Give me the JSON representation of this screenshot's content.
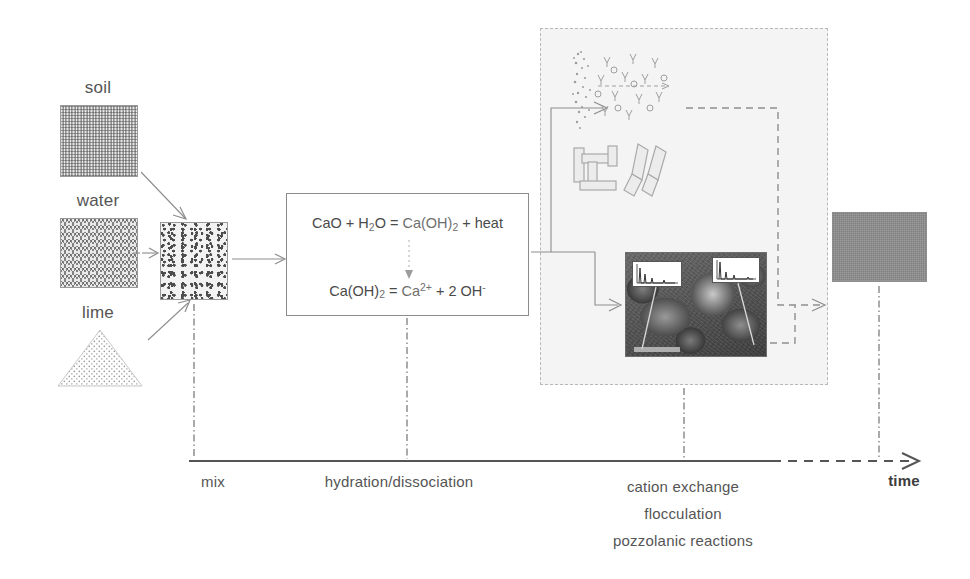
{
  "inputs": [
    {
      "key": "soil",
      "label": "soil",
      "icon": "soil-texture-swatch"
    },
    {
      "key": "water",
      "label": "water",
      "icon": "water-wave-swatch"
    },
    {
      "key": "lime",
      "label": "lime",
      "icon": "lime-powder-triangle"
    }
  ],
  "mix": {
    "label": "mix",
    "icon": "mixed-soil-swatch"
  },
  "reactions": {
    "equation_1": {
      "part_a": "CaO + H",
      "sub_a": "2",
      "part_b": "O = ",
      "part_c": "Ca(OH)",
      "sub_c": "2",
      "part_d": " + heat",
      "plain": "CaO + H2O = Ca(OH)2 + heat"
    },
    "equation_2": {
      "part_a": "Ca(OH)",
      "sub_a": "2",
      "part_b": " = ",
      "part_c": "Ca",
      "sup_c": "2+",
      "part_d": " + 2 OH",
      "sup_d": "-",
      "plain": "Ca(OH)2 = Ca2+ + 2 OH-"
    },
    "stage_label": "hydration/dissociation"
  },
  "micro_panel": {
    "diffuse_layer_caption": "clay-particle-diffuse-double-layer",
    "fabric_caption": "dispersed-and-flocculated-clay-fabric",
    "micrograph_caption": "sem-micrograph-with-eds-spectra-insets",
    "stage_lines": [
      "cation exchange",
      "flocculation",
      "pozzolanic reactions"
    ]
  },
  "product": {
    "icon": "stabilized-soil-swatch"
  },
  "timeline": {
    "axis_label": "time",
    "ticks": [
      "mix",
      "hydration/dissociation",
      "cation exchange"
    ]
  },
  "colors": {
    "text": "#555555",
    "line": "#8d8d8d",
    "axis": "#555555",
    "panel_bg": "#f4f4f4",
    "soil": "#b4b4b4",
    "product": "#8f8f8f"
  }
}
